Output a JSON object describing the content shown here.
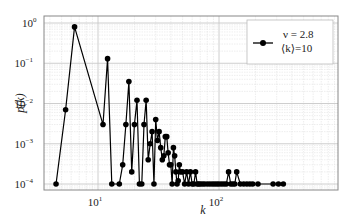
{
  "chart_data": {
    "type": "line",
    "title": "",
    "xlabel": "k",
    "ylabel": "p(k)",
    "xscale": "log",
    "yscale": "log",
    "xlim": [
      3.6,
      400
    ],
    "ylim": [
      7.5e-05,
      1.5
    ],
    "grid": true,
    "legend_position": "upper right",
    "x_ticks": [
      {
        "value": 10,
        "label": "10",
        "exp": "1"
      },
      {
        "value": 100,
        "label": "10",
        "exp": "2"
      }
    ],
    "y_ticks": [
      {
        "value": 1,
        "label": "10",
        "exp": "0"
      },
      {
        "value": 0.1,
        "label": "10",
        "exp": "−1"
      },
      {
        "value": 0.01,
        "label": "10",
        "exp": "−2"
      },
      {
        "value": 0.001,
        "label": "10",
        "exp": "−3"
      },
      {
        "value": 0.0001,
        "label": "10",
        "exp": "−4"
      }
    ],
    "series": [
      {
        "name": "ν = 2.8, ⟨k⟩=10",
        "color": "#000000",
        "marker": "circle",
        "x": [
          4.5,
          5.4,
          6.4,
          11,
          12,
          13,
          15,
          16,
          17,
          18,
          19,
          20,
          21,
          22,
          23,
          24,
          25,
          26,
          27,
          28,
          29,
          30,
          31,
          32,
          33,
          34,
          35,
          36,
          37,
          38,
          39,
          40,
          41,
          42,
          43,
          44,
          45,
          46,
          47,
          48,
          50,
          52,
          54,
          56,
          58,
          60,
          62,
          64,
          66,
          68,
          70,
          73,
          76,
          80,
          84,
          88,
          92,
          96,
          100,
          105,
          110,
          115,
          120,
          125,
          130,
          135,
          140,
          150,
          160,
          170,
          180,
          190,
          210,
          280,
          310,
          340
        ],
        "y": [
          0.0001,
          0.007,
          0.8,
          0.003,
          0.13,
          0.0001,
          0.0001,
          0.0003,
          0.003,
          0.035,
          0.0002,
          0.003,
          0.012,
          0.0001,
          0.0001,
          0.003,
          0.012,
          0.0004,
          0.001,
          0.002,
          0.0001,
          0.004,
          0.0012,
          0.002,
          0.0008,
          0.0004,
          0.0005,
          0.0015,
          0.0015,
          0.0006,
          0.0003,
          0.0003,
          0.0001,
          0.0008,
          0.0005,
          0.0002,
          0.0001,
          0.00012,
          0.0003,
          0.0002,
          0.0002,
          0.0001,
          0.0002,
          0.0001,
          0.0002,
          0.0001,
          0.0001,
          0.0002,
          0.0001,
          0.0001,
          0.0001,
          0.0001,
          0.0001,
          0.0001,
          0.0001,
          0.0001,
          0.0001,
          0.0001,
          0.0001,
          0.0001,
          0.0001,
          0.0001,
          0.0002,
          0.0001,
          0.0001,
          0.0001,
          0.0002,
          0.0001,
          0.0001,
          0.0001,
          0.0001,
          0.0001,
          0.0001,
          0.0001,
          0.0001,
          0.0001
        ]
      }
    ]
  },
  "legend": {
    "line1": "ν = 2.8",
    "line2": "⟨k⟩=10"
  },
  "axes": {
    "xlabel": "k",
    "ylabel_main": "p",
    "ylabel_arg": "(k)"
  }
}
